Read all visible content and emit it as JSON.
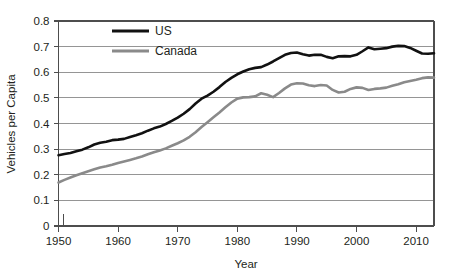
{
  "chart_data": {
    "type": "line",
    "title": "",
    "subtitle": "",
    "xlabel": "Year",
    "ylabel": "Vehicles per Capita",
    "xlim": [
      1950,
      2013
    ],
    "ylim": [
      0,
      0.8
    ],
    "grid": true,
    "legend_position": "top-left-inside",
    "x_ticks": [
      1950,
      1960,
      1970,
      1980,
      1990,
      2000,
      2010
    ],
    "x_tick_labels": [
      "1950",
      "1960",
      "1970",
      "1980",
      "1990",
      "2000",
      "2010"
    ],
    "y_ticks": [
      0,
      0.1,
      0.2,
      0.3,
      0.4,
      0.5,
      0.6,
      0.7,
      0.8
    ],
    "y_tick_labels": [
      "0",
      "0.1",
      "0.2",
      "0.3",
      "0.4",
      "0.5",
      "0.6",
      "0.7",
      "0.8"
    ],
    "x": [
      1950,
      1951,
      1952,
      1953,
      1954,
      1955,
      1956,
      1957,
      1958,
      1959,
      1960,
      1961,
      1962,
      1963,
      1964,
      1965,
      1966,
      1967,
      1968,
      1969,
      1970,
      1971,
      1972,
      1973,
      1974,
      1975,
      1976,
      1977,
      1978,
      1979,
      1980,
      1981,
      1982,
      1983,
      1984,
      1985,
      1986,
      1987,
      1988,
      1989,
      1990,
      1991,
      1992,
      1993,
      1994,
      1995,
      1996,
      1997,
      1998,
      1999,
      2000,
      2001,
      2002,
      2003,
      2004,
      2005,
      2006,
      2007,
      2008,
      2009,
      2010,
      2011,
      2012,
      2013
    ],
    "series": [
      {
        "name": "US",
        "color": "#111111",
        "line_width": 2.6,
        "values": [
          0.276,
          0.281,
          0.285,
          0.292,
          0.298,
          0.307,
          0.318,
          0.325,
          0.329,
          0.335,
          0.337,
          0.34,
          0.347,
          0.354,
          0.362,
          0.372,
          0.381,
          0.388,
          0.398,
          0.41,
          0.423,
          0.438,
          0.456,
          0.478,
          0.497,
          0.509,
          0.524,
          0.542,
          0.562,
          0.578,
          0.592,
          0.603,
          0.612,
          0.617,
          0.62,
          0.63,
          0.642,
          0.655,
          0.668,
          0.675,
          0.677,
          0.67,
          0.665,
          0.668,
          0.668,
          0.66,
          0.655,
          0.662,
          0.663,
          0.662,
          0.668,
          0.682,
          0.697,
          0.69,
          0.692,
          0.694,
          0.7,
          0.703,
          0.702,
          0.695,
          0.684,
          0.673,
          0.672,
          0.674
        ]
      },
      {
        "name": "Canada",
        "color": "#8a8a8a",
        "line_width": 2.6,
        "values": [
          0.17,
          0.18,
          0.189,
          0.198,
          0.206,
          0.214,
          0.221,
          0.228,
          0.233,
          0.239,
          0.246,
          0.252,
          0.258,
          0.264,
          0.271,
          0.28,
          0.288,
          0.295,
          0.303,
          0.313,
          0.323,
          0.334,
          0.348,
          0.366,
          0.386,
          0.405,
          0.424,
          0.443,
          0.463,
          0.482,
          0.497,
          0.502,
          0.503,
          0.506,
          0.518,
          0.512,
          0.503,
          0.519,
          0.537,
          0.552,
          0.557,
          0.556,
          0.549,
          0.546,
          0.55,
          0.548,
          0.531,
          0.521,
          0.524,
          0.535,
          0.541,
          0.539,
          0.531,
          0.535,
          0.537,
          0.54,
          0.547,
          0.553,
          0.561,
          0.566,
          0.571,
          0.577,
          0.58,
          0.579
        ]
      }
    ]
  },
  "axes": {
    "y_label": "Vehicles per Capita",
    "x_label": "Year"
  },
  "legend": {
    "items": [
      {
        "label": "US",
        "color": "#111111"
      },
      {
        "label": "Canada",
        "color": "#8a8a8a"
      }
    ]
  }
}
